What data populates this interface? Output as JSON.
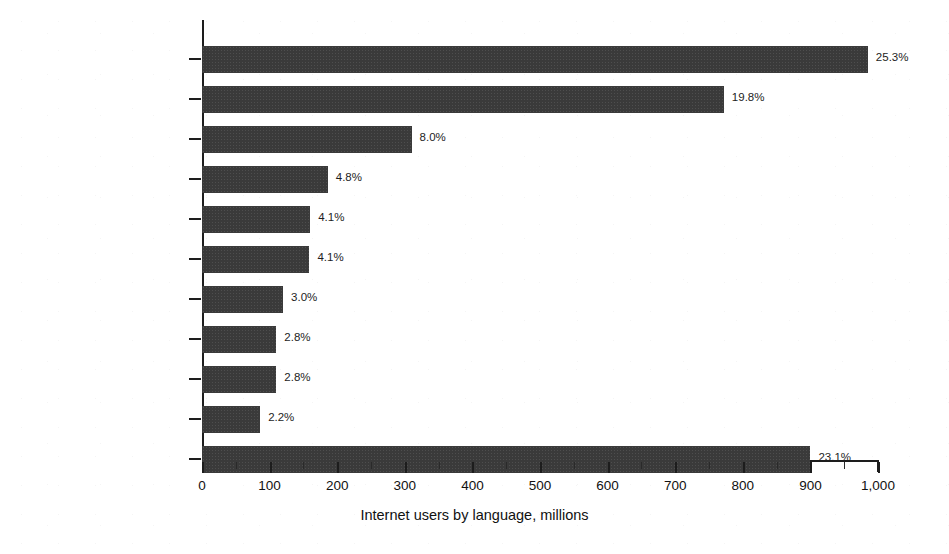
{
  "chart_data": {
    "type": "bar",
    "orientation": "horizontal",
    "title": "",
    "xlabel": "Internet users by language, millions",
    "ylabel": "",
    "xlim": [
      0,
      1000
    ],
    "grid": false,
    "legend": false,
    "categories": [
      "English",
      "Chinese",
      "Spanish",
      "Arabic",
      "Portuguese",
      "Indonesian/Malaysian",
      "Japanese",
      "Russian",
      "French",
      "German",
      "Rest of the languages"
    ],
    "values": [
      985,
      772,
      310,
      186,
      160,
      159,
      120,
      110,
      110,
      86,
      900
    ],
    "data_labels": [
      "25.3%",
      "19.8%",
      "8.0%",
      "4.8%",
      "4.1%",
      "4.1%",
      "3.0%",
      "2.8%",
      "2.8%",
      "2.2%",
      "23.1%"
    ],
    "percentages": [
      25.3,
      19.8,
      8.0,
      4.8,
      4.1,
      4.1,
      3.0,
      2.8,
      2.8,
      2.2,
      23.1
    ],
    "x_tick_labels": [
      "0",
      "100",
      "200",
      "300",
      "400",
      "500",
      "600",
      "700",
      "800",
      "900",
      "1,000"
    ],
    "x_tick_values": [
      0,
      100,
      200,
      300,
      400,
      500,
      600,
      700,
      800,
      900,
      1000
    ],
    "x_minor_tick_values": [
      50,
      150,
      250,
      350,
      450,
      550,
      650,
      750,
      850,
      950
    ],
    "colors": {
      "bar": "#3a3a3a",
      "axis": "#1d1d1d",
      "text": "#111111",
      "background": "#ffffff"
    }
  }
}
